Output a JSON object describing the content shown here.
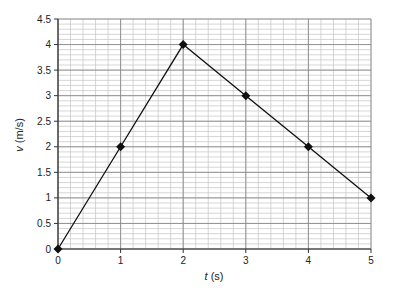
{
  "chart_data": {
    "type": "line",
    "title": "",
    "xlabel_var": "t",
    "xlabel_unit": " (s)",
    "ylabel_var": "v",
    "ylabel_unit": " (m/s)",
    "x": [
      0,
      1,
      2,
      3,
      4,
      5
    ],
    "series": [
      {
        "name": "velocity",
        "values": [
          0,
          2,
          4,
          3,
          2,
          1
        ],
        "marker": "diamond",
        "color": "#111111"
      }
    ],
    "xlim": [
      0,
      5
    ],
    "ylim": [
      0,
      4.5
    ],
    "xticks": [
      0,
      1,
      2,
      3,
      4,
      5
    ],
    "yticks": [
      0,
      0.5,
      1,
      1.5,
      2,
      2.5,
      3,
      3.5,
      4,
      4.5
    ],
    "x_minor_step": 0.2,
    "y_minor_step": 0.1,
    "grid": true,
    "legend": null
  }
}
